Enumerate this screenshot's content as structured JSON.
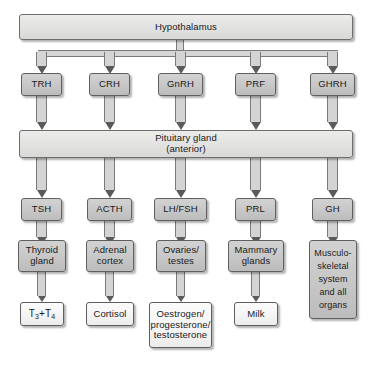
{
  "diagram": {
    "title_node": "Hypothalamus",
    "pituitary_node_line1": "Pituitary gland",
    "pituitary_node_line2": "(anterior)",
    "releasing_hormones": [
      {
        "label": "TRH"
      },
      {
        "label": "CRH"
      },
      {
        "label": "GnRH"
      },
      {
        "label": "PRF"
      },
      {
        "label": "GHRH"
      }
    ],
    "pituitary_hormones": [
      {
        "label": "TSH"
      },
      {
        "label": "ACTH"
      },
      {
        "label": "LH/FSH"
      },
      {
        "label": "PRL"
      },
      {
        "label": "GH"
      }
    ],
    "target_organs": [
      {
        "line1": "Thyroid",
        "line2": "gland"
      },
      {
        "line1": "Adrenal",
        "line2": "cortex"
      },
      {
        "line1": "Ovaries/",
        "line2": "testes"
      },
      {
        "line1": "Mammary",
        "line2": "glands"
      },
      {
        "line1": "Musculo-",
        "line2": "skeletal",
        "line3": "system",
        "line4": "and all",
        "line5": "organs"
      }
    ],
    "products": [
      {
        "label": "T3+T4",
        "main1": "T",
        "sub1": "3",
        "plus": "+",
        "main2": "T",
        "sub2": "4"
      },
      {
        "label": "Cortisol"
      },
      {
        "line1": "Oestrogen/",
        "line2": "progesterone/",
        "line3": "testosterone"
      },
      {
        "label": "Milk"
      }
    ],
    "colors": {
      "banner_fill": "#e3e3e2",
      "organ_fill": "#c8c8c8",
      "product_fill": "#f4f4f4",
      "border": "#5f5f5f",
      "arrow_head": "#5a5a5a",
      "background": "#ffffff"
    }
  }
}
